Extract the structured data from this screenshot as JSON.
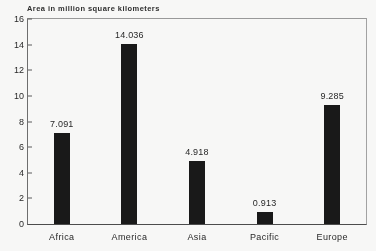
{
  "chart_data": {
    "type": "bar",
    "title": "Area in million square kilometers",
    "xlabel": "",
    "ylabel": "",
    "categories": [
      "Africa",
      "America",
      "Asia",
      "Pacific",
      "Europe"
    ],
    "values": [
      7.091,
      14.036,
      4.918,
      0.913,
      9.285
    ],
    "value_labels": [
      "7.091",
      "14.036",
      "4.918",
      "0.913",
      "9.285"
    ],
    "ylim": [
      0,
      16
    ],
    "ytick_labels": [
      "16",
      "14",
      "12",
      "10",
      "8",
      "6",
      "4",
      "2",
      "0"
    ],
    "ytick_values": [
      16,
      14,
      12,
      10,
      8,
      6,
      4,
      2,
      0
    ],
    "grid": false,
    "legend": "none",
    "bar_color": "#161616",
    "frame_color": "#6d6d6d",
    "text_color": "#262626",
    "background_color": "#fbfbfa"
  }
}
